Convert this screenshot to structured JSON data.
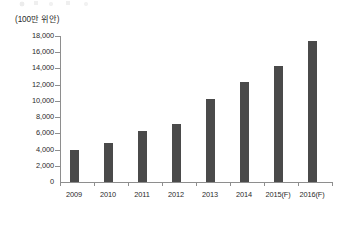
{
  "unit_label": "(100만 위안)",
  "axis_color": "#8e8e8e",
  "bar_color": "#4a4a4a",
  "text_color": "#2b2b2b",
  "chart_data": {
    "type": "bar",
    "title": "",
    "subtitle": "",
    "xlabel": "",
    "ylabel": "(100만 위안)",
    "categories": [
      "2009",
      "2010",
      "2011",
      "2012",
      "2013",
      "2014",
      "2015(F)",
      "2016(F)"
    ],
    "values": [
      4000,
      4800,
      6300,
      7200,
      10200,
      12300,
      14300,
      17400
    ],
    "series": [
      {
        "name": "",
        "values": [
          4000,
          4800,
          6300,
          7200,
          10200,
          12300,
          14300,
          17400
        ]
      }
    ],
    "ylim": [
      0,
      18000
    ],
    "ytick_step": 2000,
    "ytick_labels": [
      "0",
      "2,000",
      "4,000",
      "6,000",
      "8,000",
      "10,000",
      "12,000",
      "14,000",
      "16,000",
      "18,000"
    ],
    "ytick_values": [
      0,
      2000,
      4000,
      6000,
      8000,
      10000,
      12000,
      14000,
      16000,
      18000
    ],
    "grid": false,
    "legend": false,
    "legend_position": "none"
  }
}
